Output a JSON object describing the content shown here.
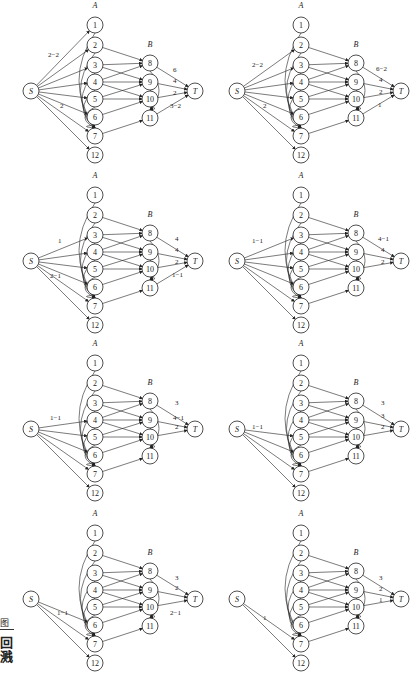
{
  "layout": {
    "panel_positions": [
      [
        0,
        0
      ],
      [
        206,
        0
      ],
      [
        0,
        170
      ],
      [
        206,
        170
      ],
      [
        0,
        338
      ],
      [
        206,
        338
      ],
      [
        0,
        508
      ],
      [
        206,
        508
      ]
    ]
  },
  "node_positions": {
    "S": [
      31,
      91
    ],
    "1": [
      95,
      25
    ],
    "2": [
      95,
      45
    ],
    "3": [
      95,
      65
    ],
    "4": [
      95,
      82
    ],
    "5": [
      95,
      99
    ],
    "6": [
      95,
      117
    ],
    "7": [
      95,
      136
    ],
    "12": [
      95,
      155
    ],
    "8": [
      150,
      63
    ],
    "9": [
      150,
      82
    ],
    "10": [
      150,
      99
    ],
    "11": [
      150,
      118
    ],
    "T": [
      195,
      91
    ]
  },
  "group_labels": {
    "A": "A",
    "B": "B",
    "A_pos": [
      95,
      8
    ],
    "B_pos": [
      150,
      47
    ]
  },
  "panels": [
    {
      "source_edges": [
        "1",
        "2",
        "3",
        "4",
        "5",
        "6",
        "7",
        "12"
      ],
      "a_to_7": [
        "1",
        "2",
        "3",
        "4",
        "5",
        "6"
      ],
      "sink_edges": [
        "8",
        "9",
        "10",
        "11"
      ],
      "labels": [
        {
          "text": "2−2",
          "x": 48,
          "y": 57
        },
        {
          "text": "2",
          "x": 60,
          "y": 108
        },
        {
          "text": "6",
          "x": 173,
          "y": 72
        },
        {
          "text": "4",
          "x": 173,
          "y": 83
        },
        {
          "text": "2",
          "x": 173,
          "y": 95
        },
        {
          "text": "3−2",
          "x": 170,
          "y": 108
        }
      ]
    },
    {
      "source_edges": [
        "2",
        "3",
        "4",
        "5",
        "6",
        "7",
        "12"
      ],
      "a_to_7": [
        "1",
        "2",
        "3",
        "4",
        "5",
        "6"
      ],
      "sink_edges": [
        "8",
        "9",
        "10",
        "11"
      ],
      "labels": [
        {
          "text": "2−2",
          "x": 46,
          "y": 67
        },
        {
          "text": "2",
          "x": 57,
          "y": 108
        },
        {
          "text": "6−2",
          "x": 170,
          "y": 71
        },
        {
          "text": "4",
          "x": 173,
          "y": 82
        },
        {
          "text": "2",
          "x": 173,
          "y": 94
        },
        {
          "text": "1",
          "x": 172,
          "y": 107
        }
      ]
    },
    {
      "source_edges": [
        "3",
        "4",
        "5",
        "6",
        "7",
        "12"
      ],
      "a_to_7": [
        "1",
        "2",
        "3",
        "4",
        "5",
        "6"
      ],
      "sink_edges": [
        "8",
        "9",
        "10",
        "11"
      ],
      "labels": [
        {
          "text": "1",
          "x": 58,
          "y": 73
        },
        {
          "text": "2−1",
          "x": 50,
          "y": 108
        },
        {
          "text": "4",
          "x": 175,
          "y": 71
        },
        {
          "text": "4",
          "x": 175,
          "y": 82
        },
        {
          "text": "2",
          "x": 175,
          "y": 94
        },
        {
          "text": "1−1",
          "x": 172,
          "y": 107
        }
      ]
    },
    {
      "source_edges": [
        "3",
        "4",
        "5",
        "6",
        "7",
        "12"
      ],
      "a_to_7": [
        "1",
        "2",
        "3",
        "4",
        "5",
        "6"
      ],
      "sink_edges": [
        "8",
        "9",
        "10"
      ],
      "labels": [
        {
          "text": "1−1",
          "x": 46,
          "y": 73
        },
        {
          "text": "4−1",
          "x": 172,
          "y": 71
        },
        {
          "text": "4",
          "x": 175,
          "y": 82
        },
        {
          "text": "2",
          "x": 175,
          "y": 94
        }
      ]
    },
    {
      "source_edges": [
        "4",
        "5",
        "6",
        "7",
        "12"
      ],
      "a_to_7": [
        "1",
        "2",
        "3",
        "4",
        "5",
        "6"
      ],
      "sink_edges": [
        "8",
        "9",
        "10"
      ],
      "labels": [
        {
          "text": "1−1",
          "x": 50,
          "y": 82
        },
        {
          "text": "3",
          "x": 175,
          "y": 67
        },
        {
          "text": "4−1",
          "x": 173,
          "y": 82
        },
        {
          "text": "2",
          "x": 175,
          "y": 91
        }
      ]
    },
    {
      "source_edges": [
        "5",
        "6",
        "7",
        "12"
      ],
      "a_to_7": [
        "1",
        "2",
        "3",
        "4",
        "5",
        "6"
      ],
      "sink_edges": [
        "8",
        "9",
        "10"
      ],
      "labels": [
        {
          "text": "1−1",
          "x": 46,
          "y": 91
        },
        {
          "text": "3",
          "x": 175,
          "y": 67
        },
        {
          "text": "3",
          "x": 175,
          "y": 80
        },
        {
          "text": "2",
          "x": 175,
          "y": 91
        }
      ]
    },
    {
      "source_edges": [
        "6",
        "7",
        "12"
      ],
      "a_to_7": [
        "1",
        "2",
        "3",
        "4",
        "5",
        "6"
      ],
      "sink_edges": [
        "8",
        "9",
        "10"
      ],
      "labels": [
        {
          "text": "1−1",
          "x": 57,
          "y": 107
        },
        {
          "text": "3",
          "x": 175,
          "y": 72
        },
        {
          "text": "2",
          "x": 175,
          "y": 82
        },
        {
          "text": "2−1",
          "x": 170,
          "y": 107
        }
      ]
    },
    {
      "source_edges": [
        "7",
        "12"
      ],
      "a_to_7": [
        "1",
        "2",
        "3",
        "4",
        "5",
        "6"
      ],
      "sink_edges": [
        "8",
        "9",
        "10"
      ],
      "labels": [
        {
          "text": "1",
          "x": 57,
          "y": 112
        },
        {
          "text": "3",
          "x": 173,
          "y": 72
        },
        {
          "text": "2",
          "x": 173,
          "y": 83
        },
        {
          "text": "1",
          "x": 173,
          "y": 94
        }
      ]
    }
  ],
  "a_to_b_edges": [
    [
      "2",
      "8"
    ],
    [
      "3",
      "8"
    ],
    [
      "3",
      "9"
    ],
    [
      "4",
      "8"
    ],
    [
      "4",
      "9"
    ],
    [
      "4",
      "10"
    ],
    [
      "5",
      "9"
    ],
    [
      "5",
      "10"
    ],
    [
      "6",
      "10"
    ],
    [
      "7",
      "11"
    ]
  ],
  "b_to_11_edges": [
    "8",
    "9",
    "10"
  ],
  "corner": {
    "figure_char": "图",
    "qr_text": "回\n溅"
  }
}
